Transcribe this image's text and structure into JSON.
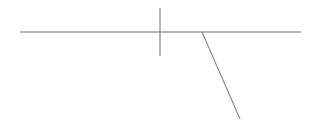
{
  "diagram": {
    "width": 316,
    "height": 130,
    "stroke_color": "#707070",
    "lines": [
      {
        "name": "horizontal-line",
        "x1": 20,
        "y1": 32,
        "x2": 301,
        "y2": 32
      },
      {
        "name": "vertical-line",
        "x1": 160,
        "y1": 8,
        "x2": 160,
        "y2": 56
      },
      {
        "name": "diagonal-line",
        "x1": 202,
        "y1": 32,
        "x2": 240,
        "y2": 119
      }
    ]
  }
}
